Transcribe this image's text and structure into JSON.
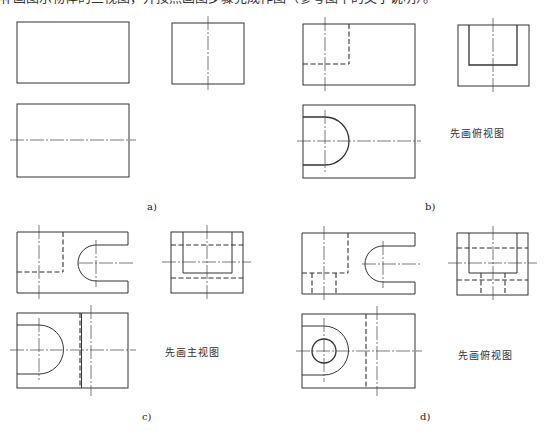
{
  "header": {
    "text": "补画图示物体的三视图，并按照画图步骤完成作图（参考图中的文字说明）。"
  },
  "panels": [
    {
      "id": "a",
      "label": "a)",
      "note": ""
    },
    {
      "id": "b",
      "label": "b)",
      "note": "先画俯视图"
    },
    {
      "id": "c",
      "label": "c)",
      "note": "先画主视图"
    },
    {
      "id": "d",
      "label": "d)",
      "note": "先画俯视图"
    }
  ],
  "style": {
    "line_color": "#333333",
    "center_line_color": "#444444"
  }
}
